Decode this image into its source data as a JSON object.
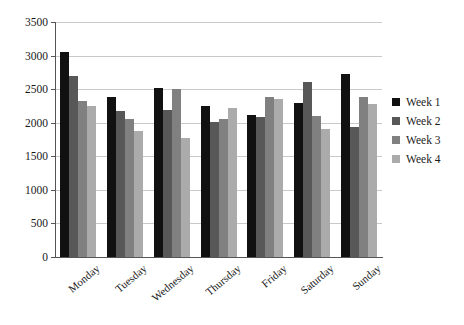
{
  "chart_data": {
    "type": "bar",
    "title": "",
    "xlabel": "",
    "ylabel": "",
    "ylim": [
      0,
      3500
    ],
    "ytick_step": 500,
    "yticks": [
      0,
      500,
      1000,
      1500,
      2000,
      2500,
      3000,
      3500
    ],
    "grid": true,
    "legend_position": "right",
    "categories": [
      "Monday",
      "Tuesday",
      "Wednesday",
      "Thursday",
      "Friday",
      "Saturday",
      "Sunday"
    ],
    "series": [
      {
        "name": "Week 1",
        "color": "#111111",
        "values": [
          3060,
          2390,
          2520,
          2250,
          2120,
          2300,
          2730
        ]
      },
      {
        "name": "Week 2",
        "color": "#585858",
        "values": [
          2690,
          2180,
          2190,
          2010,
          2080,
          2610,
          1940
        ]
      },
      {
        "name": "Week 3",
        "color": "#808080",
        "values": [
          2320,
          2060,
          2500,
          2050,
          2380,
          2100,
          2390
        ]
      },
      {
        "name": "Week 4",
        "color": "#ababab",
        "values": [
          2250,
          1870,
          1780,
          2220,
          2350,
          1900,
          2280
        ]
      }
    ]
  }
}
